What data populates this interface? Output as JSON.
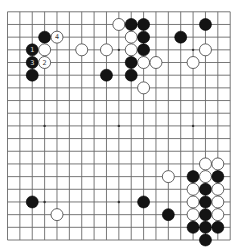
{
  "board": {
    "size": 19,
    "colors": {
      "background": "#ffffff",
      "line": "#6a6a6a",
      "black": "#141414",
      "white": "#ffffff",
      "white_outline": "#3c3c3c"
    },
    "star_points": [
      [
        3,
        3
      ],
      [
        3,
        9
      ],
      [
        3,
        15
      ],
      [
        9,
        3
      ],
      [
        9,
        9
      ],
      [
        9,
        15
      ],
      [
        15,
        3
      ],
      [
        15,
        9
      ],
      [
        15,
        15
      ]
    ],
    "stones": [
      {
        "color": "black",
        "col": 3,
        "row": 2
      },
      {
        "color": "white",
        "col": 4,
        "row": 2,
        "label": "4"
      },
      {
        "color": "black",
        "col": 2,
        "row": 3,
        "label": "1"
      },
      {
        "color": "white",
        "col": 3,
        "row": 3
      },
      {
        "color": "black",
        "col": 2,
        "row": 4,
        "label": "3"
      },
      {
        "color": "white",
        "col": 3,
        "row": 4,
        "label": "2"
      },
      {
        "color": "black",
        "col": 2,
        "row": 5
      },
      {
        "color": "white",
        "col": 9,
        "row": 1
      },
      {
        "color": "black",
        "col": 10,
        "row": 1
      },
      {
        "color": "black",
        "col": 11,
        "row": 1
      },
      {
        "color": "white",
        "col": 10,
        "row": 2
      },
      {
        "color": "black",
        "col": 11,
        "row": 2
      },
      {
        "color": "white",
        "col": 6,
        "row": 3
      },
      {
        "color": "white",
        "col": 8,
        "row": 3
      },
      {
        "color": "white",
        "col": 10,
        "row": 3
      },
      {
        "color": "black",
        "col": 11,
        "row": 3
      },
      {
        "color": "black",
        "col": 10,
        "row": 4
      },
      {
        "color": "white",
        "col": 11,
        "row": 4
      },
      {
        "color": "white",
        "col": 12,
        "row": 4
      },
      {
        "color": "black",
        "col": 8,
        "row": 5
      },
      {
        "color": "black",
        "col": 10,
        "row": 5
      },
      {
        "color": "white",
        "col": 11,
        "row": 6
      },
      {
        "color": "black",
        "col": 16,
        "row": 1
      },
      {
        "color": "black",
        "col": 14,
        "row": 2
      },
      {
        "color": "white",
        "col": 16,
        "row": 3
      },
      {
        "color": "white",
        "col": 15,
        "row": 4
      },
      {
        "color": "black",
        "col": 2,
        "row": 15
      },
      {
        "color": "white",
        "col": 4,
        "row": 16
      },
      {
        "color": "black",
        "col": 11,
        "row": 15
      },
      {
        "color": "white",
        "col": 16,
        "row": 12
      },
      {
        "color": "white",
        "col": 17,
        "row": 12
      },
      {
        "color": "white",
        "col": 13,
        "row": 13
      },
      {
        "color": "black",
        "col": 15,
        "row": 13
      },
      {
        "color": "white",
        "col": 16,
        "row": 13
      },
      {
        "color": "black",
        "col": 17,
        "row": 13
      },
      {
        "color": "white",
        "col": 15,
        "row": 14
      },
      {
        "color": "black",
        "col": 16,
        "row": 14
      },
      {
        "color": "white",
        "col": 17,
        "row": 14
      },
      {
        "color": "white",
        "col": 15,
        "row": 15
      },
      {
        "color": "black",
        "col": 16,
        "row": 15
      },
      {
        "color": "white",
        "col": 17,
        "row": 15
      },
      {
        "color": "black",
        "col": 13,
        "row": 16
      },
      {
        "color": "white",
        "col": 15,
        "row": 16
      },
      {
        "color": "black",
        "col": 16,
        "row": 16
      },
      {
        "color": "white",
        "col": 17,
        "row": 16
      },
      {
        "color": "black",
        "col": 15,
        "row": 17
      },
      {
        "color": "black",
        "col": 16,
        "row": 17
      },
      {
        "color": "black",
        "col": 17,
        "row": 17
      },
      {
        "color": "black",
        "col": 16,
        "row": 18
      }
    ],
    "move_labels": [
      {
        "number": "1",
        "color": "black",
        "col": 2,
        "row": 3
      },
      {
        "number": "2",
        "color": "white",
        "col": 3,
        "row": 4
      },
      {
        "number": "3",
        "color": "black",
        "col": 2,
        "row": 4
      },
      {
        "number": "4",
        "color": "white",
        "col": 4,
        "row": 2
      }
    ]
  }
}
